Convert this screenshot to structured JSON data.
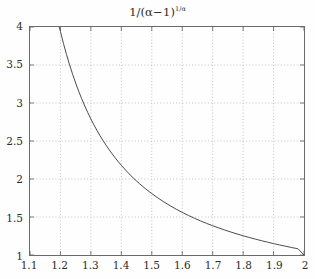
{
  "chart_data": {
    "type": "line",
    "title_parts": {
      "numerator": "1",
      "slash": "/",
      "open_paren": "(",
      "alpha": "α",
      "minus_one": "−1",
      "close_paren": ")",
      "exponent": "1/α"
    },
    "xlabel": "",
    "ylabel": "",
    "xlim": [
      1.1,
      2.0
    ],
    "ylim": [
      1.0,
      4.0
    ],
    "xticks": [
      "1.1",
      "1.2",
      "1.3",
      "1.4",
      "1.5",
      "1.6",
      "1.7",
      "1.8",
      "1.9",
      "2"
    ],
    "xtick_values": [
      1.1,
      1.2,
      1.3,
      1.4,
      1.5,
      1.6,
      1.7,
      1.8,
      1.9,
      2.0
    ],
    "yticks": [
      "1",
      "1.5",
      "2",
      "2.5",
      "3",
      "3.5",
      "4"
    ],
    "ytick_values": [
      1.0,
      1.5,
      2.0,
      2.5,
      3.0,
      3.5,
      4.0
    ],
    "grid": true,
    "grid_style": "dotted",
    "legend": null,
    "legend_position": "none",
    "series": [
      {
        "name": "1/(α−1)^(1/α)",
        "color": "#4a4a4a",
        "linewidth": 1.0,
        "x": [
          1.196,
          1.2,
          1.21,
          1.22,
          1.23,
          1.24,
          1.25,
          1.26,
          1.27,
          1.28,
          1.29,
          1.3,
          1.31,
          1.32,
          1.33,
          1.34,
          1.35,
          1.36,
          1.37,
          1.38,
          1.39,
          1.4,
          1.42,
          1.44,
          1.46,
          1.48,
          1.5,
          1.52,
          1.54,
          1.56,
          1.58,
          1.6,
          1.62,
          1.64,
          1.66,
          1.68,
          1.7,
          1.72,
          1.74,
          1.76,
          1.78,
          1.8,
          1.82,
          1.84,
          1.86,
          1.88,
          1.9,
          1.92,
          1.94,
          1.96,
          1.98,
          2.0
        ],
        "y": [
          4.0,
          3.94,
          3.782,
          3.637,
          3.502,
          3.378,
          3.262,
          3.154,
          3.054,
          2.96,
          2.872,
          2.79,
          2.712,
          2.639,
          2.57,
          2.505,
          2.444,
          2.385,
          2.33,
          2.277,
          2.227,
          2.18,
          2.091,
          2.01,
          1.937,
          1.87,
          1.808,
          1.751,
          1.698,
          1.649,
          1.603,
          1.561,
          1.521,
          1.484,
          1.449,
          1.416,
          1.385,
          1.356,
          1.328,
          1.302,
          1.277,
          1.253,
          1.231,
          1.209,
          1.189,
          1.169,
          1.15,
          1.132,
          1.115,
          1.098,
          1.082,
          1.0
        ]
      }
    ],
    "formula_note": "y = 1/(x-1)^(1/x)"
  },
  "style": {
    "background": "#fefefe",
    "frame_color": "#6a6a6a",
    "grid_color": "#bcbcbc",
    "curve_color": "#4a4a4a",
    "text_color": "#2b2b2b"
  }
}
